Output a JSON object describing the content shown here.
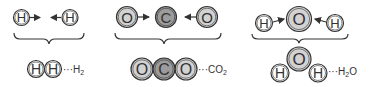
{
  "diagram": {
    "colors": {
      "H": "#ffffff",
      "O": "#d2d2d2",
      "C": "#9c9c9c",
      "stroke": "#333333"
    },
    "molecules": [
      {
        "id": "h2",
        "reactants": [
          "H",
          "H"
        ],
        "product_atoms": [
          "H",
          "H"
        ],
        "label_dots": "···",
        "label": "H",
        "label_sub": "2"
      },
      {
        "id": "co2",
        "reactants": [
          "O",
          "C",
          "O"
        ],
        "product_atoms": [
          "O",
          "C",
          "O"
        ],
        "label_dots": "···",
        "label": "CO",
        "label_sub": "2"
      },
      {
        "id": "h2o",
        "reactants": [
          "H",
          "O",
          "H"
        ],
        "product_atoms": [
          "H",
          "O",
          "H"
        ],
        "label_dots": "···",
        "label": "H",
        "label_sub": "2",
        "label_tail": "O"
      }
    ],
    "atoms": {
      "h2_r1": "H",
      "h2_r2": "H",
      "h2_p1": "H",
      "h2_p2": "H",
      "co2_r1": "O",
      "co2_r2": "C",
      "co2_r3": "O",
      "co2_p1": "O",
      "co2_p2": "C",
      "co2_p3": "O",
      "h2o_r1": "H",
      "h2o_r2": "O",
      "h2o_r3": "H",
      "h2o_p1": "H",
      "h2o_p2": "O",
      "h2o_p3": "H"
    },
    "labels": {
      "h2": {
        "dots": "···",
        "main": "H",
        "sub": "2",
        "tail": ""
      },
      "co2": {
        "dots": "···",
        "main": "CO",
        "sub": "2",
        "tail": ""
      },
      "h2o": {
        "dots": "···",
        "main": "H",
        "sub": "2",
        "tail": "O"
      }
    }
  }
}
